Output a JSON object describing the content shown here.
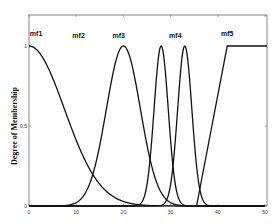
{
  "chart_data": {
    "type": "line",
    "title": "",
    "xlabel": "",
    "ylabel": "Degree of Membership",
    "xlim": [
      0,
      50
    ],
    "ylim": [
      0,
      1
    ],
    "xticks": [
      0,
      10,
      20,
      30,
      40,
      50
    ],
    "yticks": [
      0,
      0.5,
      1
    ],
    "ytick_labels": [
      "0",
      "0.5",
      "1"
    ],
    "grid": false,
    "legend": "none",
    "annotations": [
      {
        "text": "mf1",
        "x": 1.5,
        "y": 1.06
      },
      {
        "text": "mf2",
        "x": 10.5,
        "y": 1.05
      },
      {
        "text": "mf3",
        "x": 19,
        "y": 1.05
      },
      {
        "text": "mf4",
        "x": 31,
        "y": 1.05
      },
      {
        "text": "mf5",
        "x": 42,
        "y": 1.06
      }
    ],
    "series": [
      {
        "name": "mf1",
        "shape": "gaussian",
        "center": 0,
        "sigma": 7.5
      },
      {
        "name": "mf3",
        "shape": "gaussian",
        "center": 20,
        "sigma": 3.6
      },
      {
        "name": "mf4a",
        "shape": "gaussian",
        "center": 28,
        "sigma": 1.5
      },
      {
        "name": "mf4b",
        "shape": "gaussian",
        "center": 33,
        "sigma": 1.5
      },
      {
        "name": "mf5",
        "shape": "trapezoid",
        "points": [
          [
            35.5,
            0
          ],
          [
            42,
            1
          ],
          [
            50,
            1
          ]
        ]
      }
    ],
    "line_color": "#111111"
  }
}
